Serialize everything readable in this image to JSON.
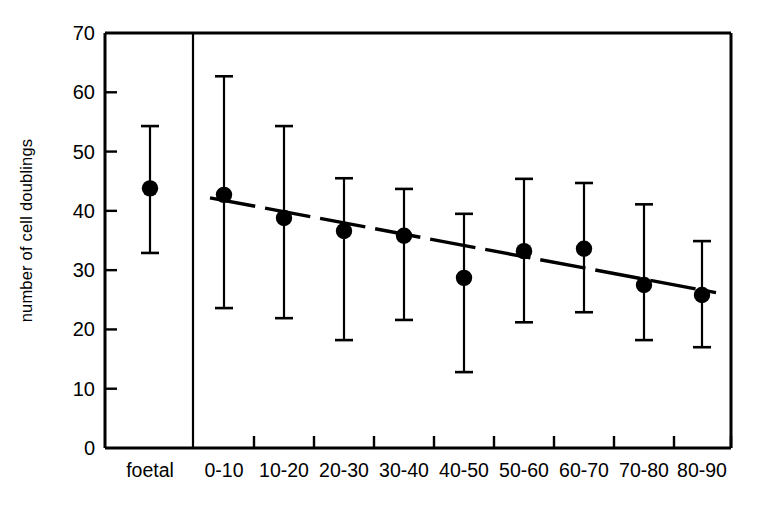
{
  "chart_data": {
    "type": "scatter",
    "title": "",
    "subtitle": "",
    "xlabel": "",
    "ylabel": "number of cell doublings",
    "ylim": [
      0,
      70
    ],
    "yticks": [
      0,
      10,
      20,
      30,
      40,
      50,
      60,
      70
    ],
    "ytick_labels": [
      "0",
      "10",
      "20",
      "30",
      "40",
      "50",
      "60",
      "70"
    ],
    "grid": false,
    "legend": null,
    "categories": [
      "foetal",
      "0-10",
      "10-20",
      "20-30",
      "30-40",
      "40-50",
      "50-60",
      "60-70",
      "70-80",
      "80-90"
    ],
    "series": [
      {
        "name": "number of cell doublings",
        "marker": "filled-circle",
        "errorbar": "range",
        "points": [
          {
            "category": "foetal",
            "value": 43.8,
            "low": 32.9,
            "high": 54.3,
            "separated": true
          },
          {
            "category": "0-10",
            "value": 42.7,
            "low": 23.6,
            "high": 62.7,
            "separated": false
          },
          {
            "category": "10-20",
            "value": 38.8,
            "low": 21.9,
            "high": 54.3,
            "separated": false
          },
          {
            "category": "20-30",
            "value": 36.6,
            "low": 18.2,
            "high": 45.5,
            "separated": false
          },
          {
            "category": "30-40",
            "value": 35.8,
            "low": 21.6,
            "high": 43.7,
            "separated": false
          },
          {
            "category": "40-50",
            "value": 28.7,
            "low": 12.8,
            "high": 39.5,
            "separated": false
          },
          {
            "category": "50-60",
            "value": 33.2,
            "low": 21.2,
            "high": 45.4,
            "separated": false
          },
          {
            "category": "60-70",
            "value": 33.6,
            "low": 22.9,
            "high": 44.7,
            "separated": false
          },
          {
            "category": "70-80",
            "value": 27.5,
            "low": 18.2,
            "high": 41.1,
            "separated": false
          },
          {
            "category": "80-90",
            "value": 25.8,
            "low": 17.0,
            "high": 34.9,
            "separated": false
          }
        ]
      }
    ],
    "trendline": {
      "style": "dashed",
      "from": {
        "category": "0-10",
        "value": 42.2
      },
      "to": {
        "category": "80-90",
        "value": 26.2
      }
    },
    "colors": {
      "axis": "#000000",
      "marker": "#000000",
      "errorbar": "#000000",
      "trendline": "#000000",
      "background": "#ffffff"
    }
  }
}
